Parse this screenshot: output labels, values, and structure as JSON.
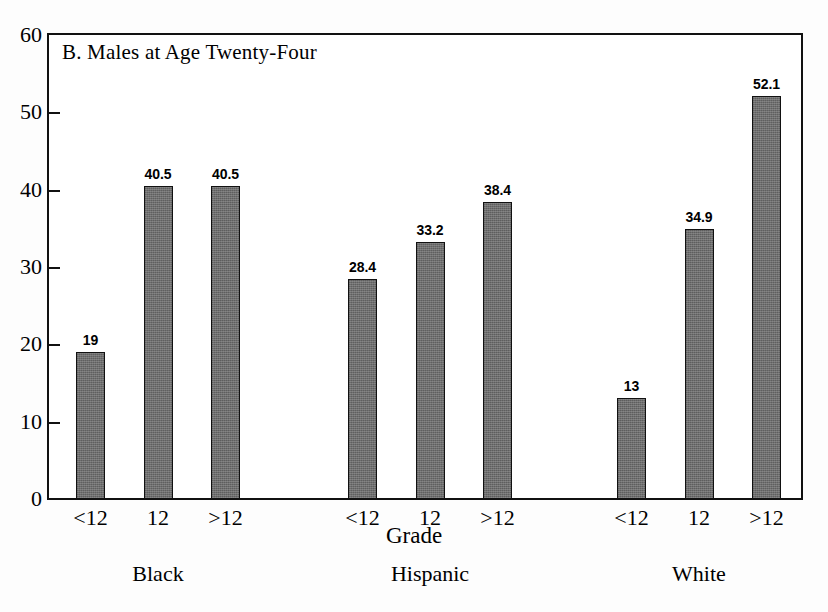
{
  "chart_data": {
    "type": "bar",
    "title": "B.  Males at Age Twenty-Four",
    "xlabel": "Grade",
    "ylabel": "",
    "ylim": [
      0,
      60
    ],
    "yticks": [
      0,
      10,
      20,
      30,
      40,
      50,
      60
    ],
    "ytick_labels": [
      "0",
      "10",
      "20",
      "30",
      "40",
      "50",
      "60"
    ],
    "grid": false,
    "legend": "none",
    "categories": [
      "<12",
      "12",
      ">12"
    ],
    "groups": [
      {
        "name": "Black",
        "bars": [
          {
            "category": "<12",
            "value": 19,
            "label": "19"
          },
          {
            "category": "12",
            "value": 40.5,
            "label": "40.5"
          },
          {
            "category": ">12",
            "value": 40.5,
            "label": "40.5"
          }
        ]
      },
      {
        "name": "Hispanic",
        "bars": [
          {
            "category": "<12",
            "value": 28.4,
            "label": "28.4"
          },
          {
            "category": "12",
            "value": 33.2,
            "label": "33.2"
          },
          {
            "category": ">12",
            "value": 38.4,
            "label": "38.4"
          }
        ]
      },
      {
        "name": "White",
        "bars": [
          {
            "category": "<12",
            "value": 13,
            "label": "13"
          },
          {
            "category": "12",
            "value": 34.9,
            "label": "34.9"
          },
          {
            "category": ">12",
            "value": 52.1,
            "label": "52.1"
          }
        ]
      }
    ],
    "colors": {
      "bar_fill": "#6e6e6e",
      "bar_border": "#111111",
      "axis": "#111111",
      "background": "#ffffff",
      "text": "#000000"
    }
  }
}
